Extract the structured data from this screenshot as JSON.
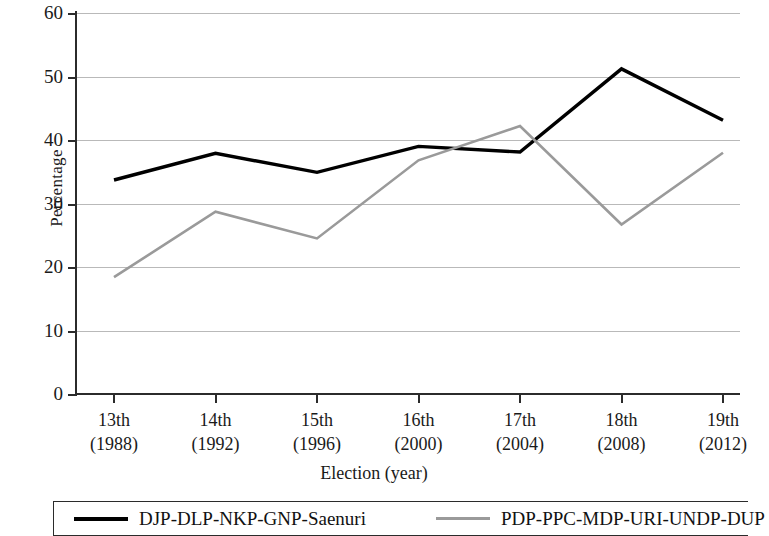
{
  "chart_data": {
    "type": "line",
    "title": "",
    "xlabel": "Election (year)",
    "ylabel": "Percentage",
    "categories": [
      "13th\n(1988)",
      "14th\n(1992)",
      "15th\n(1996)",
      "16th\n(2000)",
      "17th\n(2004)",
      "18th\n(2008)",
      "19th\n(2012)"
    ],
    "category_parts": [
      {
        "ordinal": "13th",
        "year": "(1988)"
      },
      {
        "ordinal": "14th",
        "year": "(1992)"
      },
      {
        "ordinal": "15th",
        "year": "(1996)"
      },
      {
        "ordinal": "16th",
        "year": "(2000)"
      },
      {
        "ordinal": "17th",
        "year": "(2004)"
      },
      {
        "ordinal": "18th",
        "year": "(2008)"
      },
      {
        "ordinal": "19th",
        "year": "(2012)"
      }
    ],
    "series": [
      {
        "name": "DJP-DLP-NKP-GNP-Saenuri",
        "color": "#000000",
        "width": 3.4,
        "values": [
          33.7,
          37.9,
          34.9,
          39.0,
          38.1,
          51.2,
          43.1
        ]
      },
      {
        "name": "PDP-PPC-MDP-URI-UNDP-DUP",
        "color": "#9a9a9a",
        "width": 2.6,
        "values": [
          18.4,
          28.7,
          24.5,
          36.8,
          42.2,
          26.7,
          38.0
        ]
      }
    ],
    "ylim": [
      0,
      60
    ],
    "yticks": [
      0,
      10,
      20,
      30,
      40,
      50,
      60
    ],
    "ytick_labels": [
      "0",
      "10",
      "20",
      "30",
      "40",
      "50",
      "60"
    ],
    "grid": true,
    "grid_color": "#b9b9b9",
    "legend_position": "bottom",
    "axis_color": "#2b2b2b"
  },
  "legend": {
    "entries": [
      {
        "label": "DJP-DLP-NKP-GNP-Saenuri"
      },
      {
        "label": "PDP-PPC-MDP-URI-UNDP-DUP"
      }
    ]
  }
}
